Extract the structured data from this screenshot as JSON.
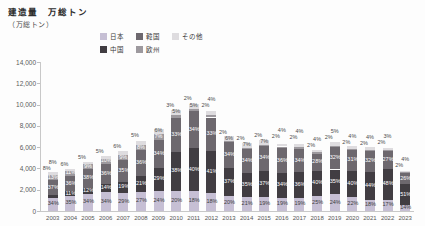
{
  "title": "建造量　万総トン",
  "y_axis": {
    "unit": "（万総トン）",
    "tick_values": [
      14000,
      12000,
      10000,
      8000,
      6000,
      4000,
      2000,
      0
    ],
    "tick_labels": [
      "14,000",
      "12,000",
      "10,000",
      "8,000",
      "6,000",
      "4,000",
      "2,000",
      "0"
    ]
  },
  "legend_rows": [
    [
      {
        "label": "日本",
        "color": "#c6bfd4"
      },
      {
        "label": "韓国",
        "color": "#6d686e"
      },
      {
        "label": "その他",
        "color": "#dedcdf"
      }
    ],
    [
      {
        "label": "中国",
        "color": "#413d42"
      },
      {
        "label": "欧州",
        "color": "#9d999e"
      }
    ]
  ],
  "chart_data": {
    "type": "bar",
    "stacked": true,
    "title": "建造量　万総トン",
    "ylabel": "（万総トン）",
    "ylim": [
      0,
      14000
    ],
    "grid": false,
    "legend_position": "top",
    "categories": [
      "2003",
      "2004",
      "2005",
      "2006",
      "2007",
      "2008",
      "2009",
      "2010",
      "2011",
      "2012",
      "2013",
      "2014",
      "2015",
      "2016",
      "2017",
      "2018",
      "2019",
      "2020",
      "2021",
      "2022",
      "2023"
    ],
    "totals_10k_gt": [
      3630,
      4030,
      4700,
      5230,
      5740,
      6780,
      7710,
      9620,
      10200,
      9550,
      7080,
      6450,
      6770,
      6660,
      6580,
      5800,
      6610,
      6130,
      5980,
      6080,
      3900
    ],
    "series": [
      {
        "name": "日本",
        "color": "#c6bfd4",
        "label_color": "#3c3c3c",
        "shares_pct": [
          34,
          35,
          34,
          34,
          29,
          27,
          24,
          20,
          18,
          18,
          20,
          21,
          19,
          19,
          19,
          25,
          24,
          22,
          18,
          17,
          14
        ]
      },
      {
        "name": "中国",
        "color": "#413d42",
        "label_color": "#ffffff",
        "shares_pct": [
          8,
          11,
          12,
          14,
          19,
          21,
          29,
          38,
          40,
          41,
          37,
          35,
          37,
          34,
          36,
          40,
          35,
          40,
          44,
          48,
          51
        ]
      },
      {
        "name": "韓国",
        "color": "#6d686e",
        "label_color": "#ffffff",
        "shares_pct": [
          37,
          36,
          38,
          36,
          35,
          36,
          34,
          33,
          34,
          33,
          34,
          34,
          34,
          36,
          34,
          28,
          32,
          31,
          32,
          27,
          26
        ]
      },
      {
        "name": "欧州",
        "color": "#9d999e",
        "label_color": "#ffffff",
        "shares_pct": [
          13,
          11,
          9,
          10,
          9,
          8,
          7,
          3,
          2,
          2,
          2,
          2,
          2,
          2,
          2,
          2,
          2,
          2,
          2,
          2,
          2
        ]
      },
      {
        "name": "その他",
        "color": "#dedcdf",
        "label_color": "#4a4a4a",
        "shares_pct": [
          8,
          6,
          5,
          5,
          6,
          5,
          6,
          5,
          5,
          4,
          6,
          7,
          7,
          4,
          4,
          4,
          5,
          4,
          4,
          3,
          4
        ]
      }
    ]
  }
}
